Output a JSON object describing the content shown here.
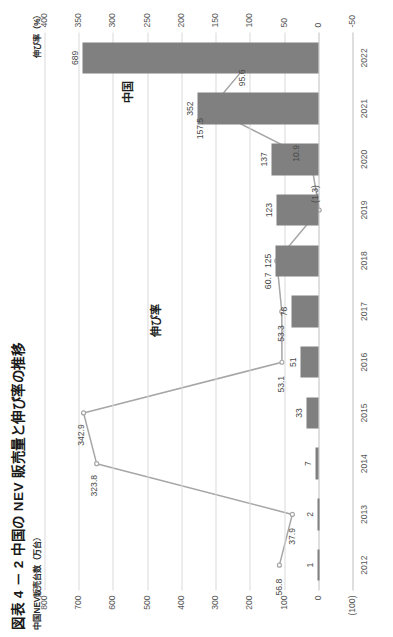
{
  "figure": {
    "title": "図表 4 － 2  中国の NEV 販売量と伸び率の推移",
    "left_axis_title": "中国NEV販売台数（万台）",
    "right_axis_title": "伸び率（%）",
    "annotation_bars": "中国",
    "annotation_line": "伸び率"
  },
  "chart_data": {
    "type": "bar",
    "title": "図表 4 － 2  中国の NEV 販売量と伸び率の推移",
    "xlabel": "",
    "ylabel": "中国NEV販売台数（万台）",
    "y2label": "伸び率（%）",
    "categories": [
      "2012",
      "2013",
      "2014",
      "2015",
      "2016",
      "2017",
      "2018",
      "2019",
      "2020",
      "2021",
      "2022"
    ],
    "ylim": [
      -100,
      800
    ],
    "y2lim": [
      -50,
      400
    ],
    "yticks": [
      "800",
      "700",
      "600",
      "500",
      "400",
      "300",
      "200",
      "100",
      "0",
      "(100)"
    ],
    "y2ticks": [
      "400",
      "350",
      "300",
      "250",
      "200",
      "150",
      "100",
      "50",
      "0",
      "-50"
    ],
    "grid": true,
    "legend_position": "annotated-inline",
    "series": [
      {
        "name": "中国",
        "kind": "bar",
        "axis": "left",
        "unit": "万台",
        "color": "#808080",
        "values": [
          1,
          2,
          7,
          33,
          51,
          78,
          125,
          123,
          137,
          352,
          689
        ],
        "labels": [
          "1",
          "2",
          "7",
          "33",
          "51",
          "78",
          "125",
          "123",
          "137",
          "352",
          "689"
        ]
      },
      {
        "name": "伸び率",
        "kind": "line",
        "axis": "right",
        "unit": "%",
        "color": "#a6a6a6",
        "values": [
          56.8,
          37.9,
          323.8,
          342.9,
          53.1,
          53.3,
          60.7,
          -1.3,
          10.9,
          157.5,
          95.6
        ],
        "labels": [
          "56.8",
          "37.9",
          "323.8",
          "342.9",
          "53.1",
          "53.3",
          "60.7",
          "(1.3)",
          "10.9",
          "157.5",
          "95.6"
        ]
      }
    ]
  }
}
